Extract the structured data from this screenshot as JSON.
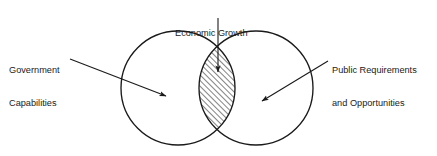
{
  "diagram": {
    "type": "venn-two-circle",
    "title_label": "Economic Growth",
    "background_color": "#ffffff",
    "stroke_color": "#1a1a1a",
    "text_color": "#1a1a1a",
    "labels": {
      "center": {
        "name": "Economic Growth",
        "lines": [
          "Economic Growth"
        ],
        "position": "top-center",
        "points_to": "intersection"
      },
      "left": {
        "name": "Government Capabilities",
        "lines": [
          "Government",
          "Capabilities"
        ],
        "position": "left",
        "points_to": "left-circle"
      },
      "right": {
        "name": "Public Requirements and Opportunities",
        "lines": [
          "Public Requirements",
          "and Opportunities"
        ],
        "position": "right",
        "points_to": "right-circle"
      }
    },
    "circles": [
      {
        "id": "left-circle",
        "label": "Government Capabilities",
        "cx": 178,
        "cy": 88,
        "r": 57
      },
      {
        "id": "right-circle",
        "label": "Public Requirements and Opportunities",
        "cx": 256,
        "cy": 88,
        "r": 57
      }
    ],
    "intersection": {
      "id": "intersection-lens",
      "label": "Economic Growth",
      "fill": "diagonal-hatch",
      "hatch_angle_degrees": 45,
      "hatch_spacing_px": 4
    },
    "leader_lines": [
      {
        "id": "center-leader",
        "from": [
          218,
          18
        ],
        "to": [
          218,
          72
        ],
        "arrow": true
      },
      {
        "id": "left-leader",
        "from": [
          70,
          59
        ],
        "to": [
          166,
          96
        ],
        "arrow": true
      },
      {
        "id": "right-leader",
        "from": [
          328,
          61
        ],
        "to": [
          262,
          101
        ],
        "arrow": true
      }
    ]
  }
}
